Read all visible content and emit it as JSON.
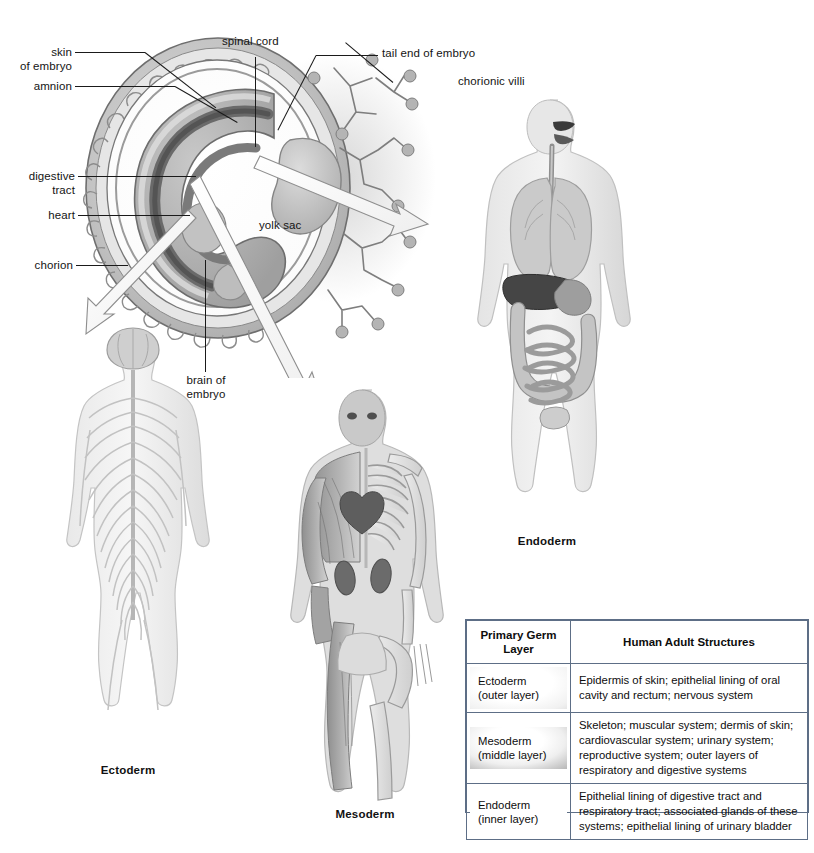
{
  "figure": {
    "background_color": "#ffffff",
    "embryo_labels": [
      {
        "id": "skin-of-embryo",
        "text": "skin\nof embryo"
      },
      {
        "id": "amnion",
        "text": "amnion"
      },
      {
        "id": "spinal-cord",
        "text": "spinal cord"
      },
      {
        "id": "tail-end-of-embryo",
        "text": "tail end of embryo"
      },
      {
        "id": "chorionic-villi",
        "text": "chorionic villi"
      },
      {
        "id": "digestive-tract",
        "text": "digestive\ntract"
      },
      {
        "id": "heart",
        "text": "heart"
      },
      {
        "id": "chorion",
        "text": "chorion"
      },
      {
        "id": "yolk-sac",
        "text": "yolk sac"
      },
      {
        "id": "brain-of-embryo",
        "text": "brain of\nembryo"
      }
    ],
    "figure_captions": [
      {
        "id": "ectoderm-figure",
        "text": "Ectoderm"
      },
      {
        "id": "mesoderm-figure",
        "text": "Mesoderm"
      },
      {
        "id": "endoderm-figure",
        "text": "Endoderm"
      }
    ]
  },
  "table": {
    "headers": [
      "Primary\nGerm Layer",
      "Human Adult Structures"
    ],
    "header_layer": "Primary\nGerm Layer",
    "header_structures": "Human Adult Structures",
    "rows": [
      {
        "layer_name": "Ectoderm",
        "layer_sub": "(outer layer)",
        "structures": "Epidermis of skin; epithelial lining of oral cavity and rectum; nervous system"
      },
      {
        "layer_name": "Mesoderm",
        "layer_sub": "(middle layer)",
        "structures": "Skeleton; muscular system; dermis of skin; cardiovascular system; urinary system; reproductive system; outer layers of respiratory and digestive systems"
      },
      {
        "layer_name": "Endoderm",
        "layer_sub": "(inner layer)",
        "structures": "Epithelial lining of digestive tract and respiratory tract; associated glands of these systems; epithelial lining of urinary bladder"
      }
    ],
    "border_color": "#5d6e86"
  }
}
